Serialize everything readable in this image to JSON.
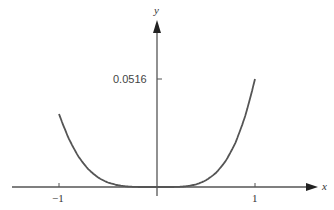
{
  "chart_data": {
    "type": "line",
    "title": "",
    "xlabel": "x",
    "ylabel": "y",
    "x_ticks": [
      "-1",
      "1"
    ],
    "y_ticks": [
      "0.0516"
    ],
    "xlim": [
      -1.0,
      1.0
    ],
    "ylim": [
      0,
      0.0516
    ],
    "grid": false,
    "legend": null,
    "series": [
      {
        "name": "curve",
        "x": [
          -1.0,
          -0.9,
          -0.8,
          -0.7,
          -0.6,
          -0.5,
          -0.4,
          -0.3,
          -0.2,
          -0.1,
          0.0,
          0.1,
          0.2,
          0.3,
          0.4,
          0.5,
          0.6,
          0.7,
          0.8,
          0.9,
          1.0
        ],
        "y": [
          0.0349,
          0.0233,
          0.0146,
          0.0085,
          0.0045,
          0.0021,
          0.0008,
          0.0002,
          0.0,
          0.0,
          0.0,
          0.0,
          0.0,
          0.0003,
          0.0012,
          0.0032,
          0.0067,
          0.0124,
          0.0211,
          0.0339,
          0.0516
        ]
      }
    ]
  },
  "axes": {
    "x_label": "x",
    "y_label": "y",
    "x_tick_neg": "−1",
    "x_tick_pos": "1",
    "y_tick": "0.0516"
  },
  "colors": {
    "axis": "#555555",
    "curve": "#555555"
  }
}
